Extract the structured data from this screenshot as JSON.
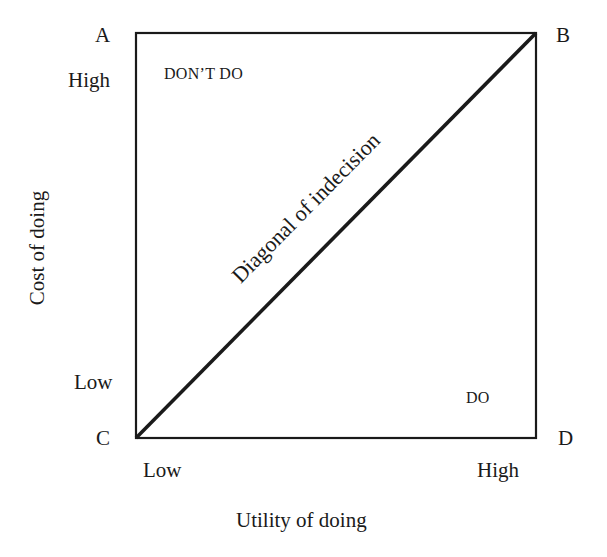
{
  "diagram": {
    "corners": {
      "a": "A",
      "b": "B",
      "c": "C",
      "d": "D"
    },
    "y_axis": {
      "label": "Cost of doing",
      "high": "High",
      "low": "Low"
    },
    "x_axis": {
      "label": "Utility of doing",
      "low": "Low",
      "high": "High"
    },
    "regions": {
      "upper_left": "DON’T DO",
      "lower_right": "DO"
    },
    "diagonal_label": "Diagonal of indecision",
    "colors": {
      "line": "#1a1a1a",
      "background": "#ffffff"
    }
  }
}
